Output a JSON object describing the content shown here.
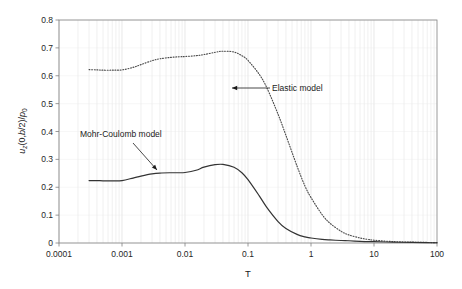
{
  "chart_data": {
    "type": "line",
    "title": "",
    "xlabel": "T",
    "ylabel": "u_z(0,b/2)/p_0",
    "xscale": "log",
    "yscale": "linear",
    "xlim": [
      0.0001,
      100
    ],
    "ylim": [
      0,
      0.8
    ],
    "grid": "minor-log-vertical",
    "xtick_labels": [
      "0.0001",
      "0.001",
      "0.01",
      "0.1",
      "1",
      "10",
      "100"
    ],
    "xtick_values": [
      0.0001,
      0.001,
      0.01,
      0.1,
      1,
      10,
      100
    ],
    "ytick_labels": [
      "0",
      "0.1",
      "0.2",
      "0.3",
      "0.4",
      "0.5",
      "0.6",
      "0.7",
      "0.8"
    ],
    "ytick_values": [
      0,
      0.1,
      0.2,
      0.3,
      0.4,
      0.5,
      0.6,
      0.7,
      0.8
    ],
    "legend_position": "inline-annotations",
    "series": [
      {
        "name": "Elastic model",
        "style": "dotted",
        "color": "#4d4d4d",
        "x": [
          0.0003,
          0.0004,
          0.0005,
          0.0007,
          0.001,
          0.0015,
          0.002,
          0.003,
          0.004,
          0.006,
          0.008,
          0.01,
          0.015,
          0.02,
          0.03,
          0.04,
          0.06,
          0.08,
          0.1,
          0.15,
          0.2,
          0.3,
          0.4,
          0.6,
          0.8,
          1,
          1.5,
          2,
          3,
          4,
          6,
          8,
          10,
          20,
          40,
          70,
          100
        ],
        "y": [
          0.622,
          0.621,
          0.62,
          0.62,
          0.621,
          0.63,
          0.64,
          0.654,
          0.661,
          0.666,
          0.668,
          0.669,
          0.672,
          0.676,
          0.684,
          0.688,
          0.685,
          0.672,
          0.655,
          0.606,
          0.556,
          0.462,
          0.386,
          0.276,
          0.205,
          0.163,
          0.102,
          0.071,
          0.042,
          0.029,
          0.018,
          0.013,
          0.01,
          0.005,
          0.003,
          0.002,
          0.001
        ]
      },
      {
        "name": "Mohr-Coulomb model",
        "style": "solid",
        "color": "#333333",
        "x": [
          0.0003,
          0.0004,
          0.0005,
          0.0007,
          0.001,
          0.0015,
          0.002,
          0.003,
          0.004,
          0.006,
          0.008,
          0.01,
          0.015,
          0.02,
          0.03,
          0.04,
          0.06,
          0.08,
          0.1,
          0.15,
          0.2,
          0.3,
          0.4,
          0.6,
          0.8,
          1,
          1.5,
          2,
          3,
          4,
          6,
          8,
          10,
          20,
          40,
          70,
          100
        ],
        "y": [
          0.224,
          0.224,
          0.223,
          0.223,
          0.224,
          0.233,
          0.24,
          0.248,
          0.251,
          0.252,
          0.252,
          0.253,
          0.261,
          0.272,
          0.281,
          0.282,
          0.272,
          0.252,
          0.227,
          0.17,
          0.127,
          0.077,
          0.052,
          0.031,
          0.022,
          0.018,
          0.013,
          0.011,
          0.009,
          0.008,
          0.006,
          0.005,
          0.005,
          0.003,
          0.002,
          0.001,
          0.001
        ]
      }
    ],
    "annotations": [
      {
        "name": "elastic-model-annotation",
        "text": "Elastic model",
        "text_x": 272,
        "text_y": 91,
        "arrow_from_x": 270,
        "arrow_from_y": 88,
        "arrow_to_x": 232,
        "arrow_to_y": 88
      },
      {
        "name": "mohr-coulomb-model-annotation",
        "text": "Mohr-Coulomb model",
        "text_x": 80,
        "text_y": 137,
        "arrow_from_x": 133,
        "arrow_from_y": 143,
        "arrow_to_x": 157,
        "arrow_to_y": 170
      }
    ]
  },
  "axes": {
    "y_label_parts": {
      "u": "u",
      "z": "z",
      "open": "(0,",
      "b": "b",
      "half": "/2)/",
      "p": "p",
      "zero": "0"
    },
    "x_label": "T"
  },
  "colors": {
    "plot_border": "#808080",
    "gridline": "#d9d9d9",
    "elastic_curve": "#4d4d4d",
    "mohr_coulomb_curve": "#333333",
    "background": "#ffffff",
    "text": "#1a1a1a"
  }
}
